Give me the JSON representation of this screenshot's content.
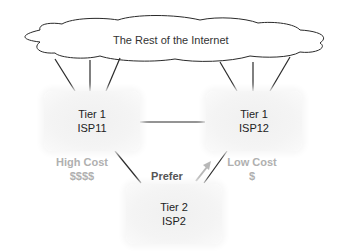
{
  "cloud": {
    "label": "The Rest of the Internet"
  },
  "nodes": [
    {
      "id": "isp11",
      "line1": "Tier 1",
      "line2": "ISP11"
    },
    {
      "id": "isp12",
      "line1": "Tier 1",
      "line2": "ISP12"
    },
    {
      "id": "isp2",
      "line1": "Tier 2",
      "line2": "ISP2"
    }
  ],
  "costs": {
    "left": {
      "label": "High Cost",
      "amount": "$$$$"
    },
    "right": {
      "label": "Low Cost",
      "amount": "$"
    }
  },
  "prefer": {
    "label": "Prefer"
  },
  "colors": {
    "line": "#2a2a2a",
    "cost_text": "#b0b0b0",
    "prefer_arrow": "#b8b8b8",
    "node_fill": "#f2f2f2"
  }
}
